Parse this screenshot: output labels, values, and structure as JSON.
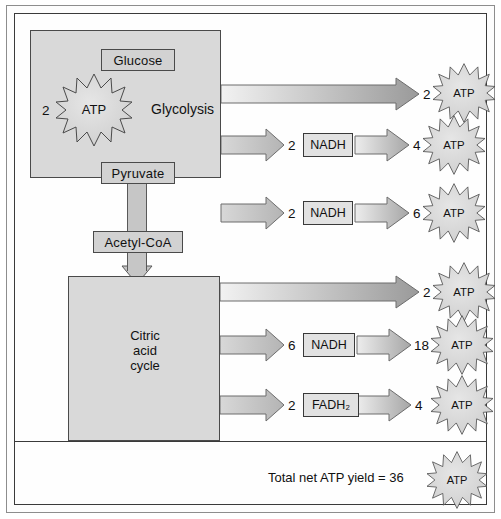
{
  "diagram": {
    "glycolysis": {
      "substrate_label": "Glucose",
      "product_label": "Pyruvate",
      "pathway_label": "Glycolysis",
      "atp_input_count": "2",
      "atp_input_label": "ATP"
    },
    "link_reaction": {
      "intermediate_label": "Acetyl-CoA"
    },
    "mitochondrion": {
      "cycle_label_line1": "Citric",
      "cycle_label_line2": "acid",
      "cycle_label_line3": "cycle"
    },
    "yield_rows": [
      {
        "id": "glycolysis-atp",
        "carrier": null,
        "carrier_count": null,
        "atp_count": "2",
        "atp_label": "ATP",
        "direct": true
      },
      {
        "id": "glycolysis-nadh",
        "carrier": "NADH",
        "carrier_count": "2",
        "atp_count": "4",
        "atp_label": "ATP",
        "direct": false
      },
      {
        "id": "pyruvate-oxidation-nadh",
        "carrier": "NADH",
        "carrier_count": "2",
        "atp_count": "6",
        "atp_label": "ATP",
        "direct": false
      },
      {
        "id": "citric-acid-atp",
        "carrier": null,
        "carrier_count": null,
        "atp_count": "2",
        "atp_label": "ATP",
        "direct": true
      },
      {
        "id": "citric-acid-nadh",
        "carrier": "NADH",
        "carrier_count": "6",
        "atp_count": "18",
        "atp_label": "ATP",
        "direct": false
      },
      {
        "id": "citric-acid-fadh2",
        "carrier": "FADH₂",
        "carrier_count": "2",
        "atp_count": "4",
        "atp_label": "ATP",
        "direct": false
      }
    ],
    "summary": {
      "text": "Total net ATP yield = 36",
      "atp_label": "ATP"
    },
    "colors": {
      "compartment_fill": "#d9d9d9",
      "box_fill": "#d2d2d2",
      "carrier_fill": "#e2e2e2",
      "burst_fill": "#dcdcdc",
      "arrow_light": "#ededed",
      "arrow_dark": "#9a9a9a",
      "stroke": "#4a4a4a",
      "frame": "#3a3a3a"
    }
  }
}
